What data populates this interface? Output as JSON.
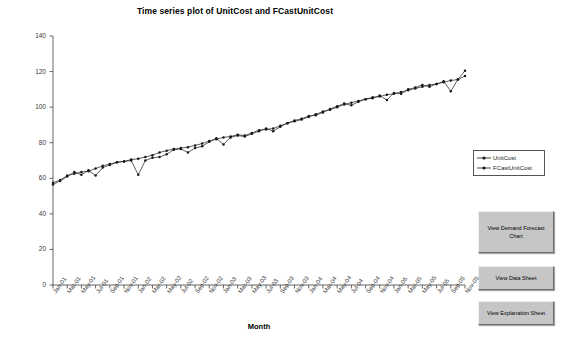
{
  "chart_data": {
    "type": "line",
    "title": "Time series plot of UnitCost and FCastUnitCost",
    "xlabel": "Month",
    "ylabel": "",
    "ylim": [
      0,
      140
    ],
    "ytick_step": 20,
    "yticks": [
      0,
      20,
      40,
      60,
      80,
      100,
      120,
      140
    ],
    "grid": false,
    "legend_position": "right",
    "x_tick_labels": [
      "Jan-01",
      "Mar-01",
      "May-01",
      "Jul-01",
      "Sep-01",
      "Nov-01",
      "Jan-02",
      "Mar-02",
      "May-02",
      "Jul-02",
      "Sep-02",
      "Nov-02",
      "Jan-03",
      "Mar-03",
      "May-03",
      "Jul-03",
      "Sep-03",
      "Nov-03",
      "Jan-04",
      "Mar-04",
      "May-04",
      "Jul-04",
      "Sep-04",
      "Nov-04",
      "Jan-05",
      "Mar-05",
      "May-05",
      "Jul-05",
      "Sep-05",
      "Nov-05"
    ],
    "x_categories": [
      "Jan-01",
      "Feb-01",
      "Mar-01",
      "Apr-01",
      "May-01",
      "Jun-01",
      "Jul-01",
      "Aug-01",
      "Sep-01",
      "Oct-01",
      "Nov-01",
      "Dec-01",
      "Jan-02",
      "Feb-02",
      "Mar-02",
      "Apr-02",
      "May-02",
      "Jun-02",
      "Jul-02",
      "Aug-02",
      "Sep-02",
      "Oct-02",
      "Nov-02",
      "Dec-02",
      "Jan-03",
      "Feb-03",
      "Mar-03",
      "Apr-03",
      "May-03",
      "Jun-03",
      "Jul-03",
      "Aug-03",
      "Sep-03",
      "Oct-03",
      "Nov-03",
      "Dec-03",
      "Jan-04",
      "Feb-04",
      "Mar-04",
      "Apr-04",
      "May-04",
      "Jun-04",
      "Jul-04",
      "Aug-04",
      "Sep-04",
      "Oct-04",
      "Nov-04",
      "Dec-04",
      "Jan-05",
      "Feb-05",
      "Mar-05",
      "Apr-05",
      "May-05",
      "Jun-05",
      "Jul-05",
      "Aug-05",
      "Sep-05",
      "Oct-05",
      "Nov-05"
    ],
    "series": [
      {
        "name": "UnitCost",
        "values": [
          56.5,
          58.5,
          61.0,
          63.5,
          62.0,
          64.5,
          61.5,
          66.0,
          67.5,
          69.0,
          69.5,
          70.0,
          62.0,
          70.0,
          71.5,
          72.0,
          73.5,
          76.0,
          76.5,
          74.5,
          77.0,
          78.0,
          80.5,
          82.5,
          79.0,
          83.0,
          84.0,
          83.5,
          85.0,
          86.5,
          88.0,
          86.5,
          89.0,
          91.0,
          92.5,
          93.5,
          95.0,
          95.5,
          97.0,
          99.0,
          100.5,
          102.0,
          101.0,
          103.0,
          104.5,
          105.0,
          106.5,
          104.0,
          108.0,
          107.5,
          110.0,
          111.0,
          112.5,
          111.5,
          113.0,
          114.5,
          109.0,
          115.5,
          120.5
        ]
      },
      {
        "name": "FCastUnitCost",
        "values": [
          57.5,
          59.0,
          61.5,
          62.5,
          63.5,
          64.0,
          65.5,
          67.0,
          68.0,
          69.0,
          69.5,
          70.5,
          71.0,
          72.0,
          73.0,
          74.5,
          75.5,
          76.5,
          77.0,
          77.5,
          78.5,
          79.5,
          81.0,
          82.0,
          83.0,
          83.5,
          84.5,
          84.0,
          85.5,
          87.0,
          87.5,
          88.0,
          89.5,
          91.0,
          92.0,
          93.0,
          94.5,
          96.0,
          97.5,
          98.5,
          100.0,
          101.5,
          102.5,
          103.5,
          104.5,
          105.5,
          106.0,
          107.0,
          107.5,
          108.5,
          109.5,
          110.5,
          111.5,
          112.5,
          113.0,
          114.0,
          115.0,
          115.5,
          117.5
        ]
      }
    ]
  },
  "legend": {
    "items": [
      {
        "label": "UnitCost"
      },
      {
        "label": "FCastUnitCost"
      }
    ]
  },
  "buttons": {
    "view_demand_forecast_chart": "View Demand Forecast Chart",
    "view_data_sheet": "View Data Sheet",
    "view_explanation_sheet": "View Explanation Sheet"
  },
  "colors": {
    "series_line": "#1a1a1a",
    "axis": "#555555",
    "button_face": "#c6c6c6",
    "background": "#ffffff"
  }
}
